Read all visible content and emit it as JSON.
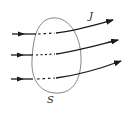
{
  "diagram": {
    "labels": {
      "current_density": "J",
      "surface": "S"
    },
    "colors": {
      "surface_stroke": "#777777",
      "flux_line": "#1a1a1a",
      "background": "#ffffff"
    },
    "flux_lines": [
      {
        "name": "flux-line-top",
        "entry_y": 34,
        "exit": [
          113,
          20
        ]
      },
      {
        "name": "flux-line-middle",
        "entry_y": 55,
        "exit": [
          118,
          40
        ]
      },
      {
        "name": "flux-line-bottom",
        "entry_y": 79,
        "exit": [
          121,
          61
        ]
      }
    ]
  }
}
